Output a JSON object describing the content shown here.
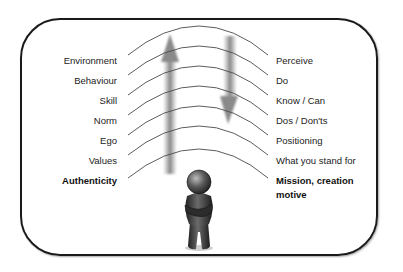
{
  "diagram": {
    "left_labels": [
      {
        "text": "Environment",
        "bold": false
      },
      {
        "text": "Behaviour",
        "bold": false
      },
      {
        "text": "Skill",
        "bold": false
      },
      {
        "text": "Norm",
        "bold": false
      },
      {
        "text": "Ego",
        "bold": false
      },
      {
        "text": "Values",
        "bold": false
      },
      {
        "text": "Authenticity",
        "bold": true
      }
    ],
    "right_labels": [
      {
        "text": "Perceive",
        "bold": false
      },
      {
        "text": "Do",
        "bold": false
      },
      {
        "text": "Know / Can",
        "bold": false
      },
      {
        "text": "Dos / Don'ts",
        "bold": false
      },
      {
        "text": "Positioning",
        "bold": false
      },
      {
        "text": "What you stand for",
        "bold": false
      },
      {
        "text": "Mission, creation",
        "bold": true
      },
      {
        "text": "motive",
        "bold": true
      }
    ],
    "arrows": [
      {
        "direction": "up",
        "icon": "up-arrow-icon"
      },
      {
        "direction": "down",
        "icon": "down-arrow-icon"
      }
    ],
    "figure": {
      "icon": "person-figure-icon"
    },
    "colors": {
      "frame": "#1a1a1a",
      "lines": "#555555",
      "arrow": "#888888",
      "figure": "#3a3a3a"
    }
  }
}
